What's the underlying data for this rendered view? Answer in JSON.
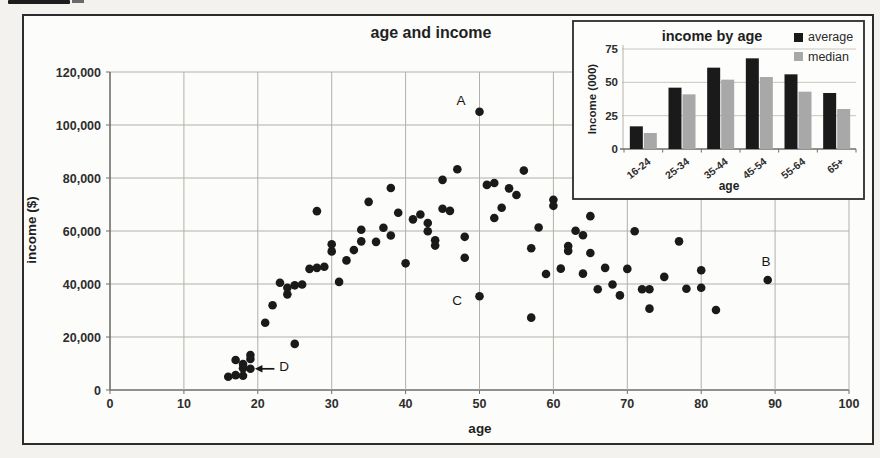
{
  "chart_data": [
    {
      "type": "scatter",
      "title": "age and income",
      "xlabel": "age",
      "ylabel": "income ($)",
      "xlim": [
        0,
        100
      ],
      "ylim": [
        0,
        120000
      ],
      "xticks": [
        0,
        10,
        20,
        30,
        40,
        50,
        60,
        70,
        80,
        90,
        100
      ],
      "yticks": [
        0,
        20000,
        40000,
        60000,
        80000,
        100000,
        120000
      ],
      "ytick_labels": [
        "0",
        "20,000",
        "40,000",
        "60,000",
        "80,000",
        "100,000",
        "120,000"
      ],
      "grid": true,
      "point_color": "#1a1a1a",
      "points": [
        [
          16,
          5000
        ],
        [
          17,
          5600
        ],
        [
          18,
          5400
        ],
        [
          18,
          8200
        ],
        [
          19,
          8000
        ],
        [
          17,
          11300
        ],
        [
          18,
          9800
        ],
        [
          19,
          13200
        ],
        [
          19,
          11700
        ],
        [
          21,
          25400
        ],
        [
          22,
          32000
        ],
        [
          23,
          40500
        ],
        [
          24,
          36100
        ],
        [
          24,
          38600
        ],
        [
          25,
          17400
        ],
        [
          25,
          39500
        ],
        [
          26,
          39800
        ],
        [
          27,
          45700
        ],
        [
          28,
          46100
        ],
        [
          29,
          46500
        ],
        [
          28,
          67500
        ],
        [
          30,
          55000
        ],
        [
          30,
          52300
        ],
        [
          31,
          40800
        ],
        [
          32,
          48900
        ],
        [
          33,
          52800
        ],
        [
          34,
          60500
        ],
        [
          34,
          56100
        ],
        [
          35,
          71000
        ],
        [
          36,
          55900
        ],
        [
          37,
          61200
        ],
        [
          38,
          58300
        ],
        [
          38,
          76200
        ],
        [
          39,
          66900
        ],
        [
          40,
          47800
        ],
        [
          41,
          64400
        ],
        [
          42,
          66200
        ],
        [
          43,
          63000
        ],
        [
          43,
          59900
        ],
        [
          44,
          56500
        ],
        [
          44,
          54500
        ],
        [
          45,
          79300
        ],
        [
          45,
          68400
        ],
        [
          46,
          67600
        ],
        [
          47,
          83300
        ],
        [
          48,
          57800
        ],
        [
          48,
          49900
        ],
        [
          50,
          105000
        ],
        [
          50,
          35400
        ],
        [
          51,
          77400
        ],
        [
          52,
          78100
        ],
        [
          52,
          64900
        ],
        [
          53,
          68800
        ],
        [
          54,
          76100
        ],
        [
          55,
          73600
        ],
        [
          56,
          82800
        ],
        [
          57,
          53500
        ],
        [
          57,
          27300
        ],
        [
          58,
          61300
        ],
        [
          59,
          43800
        ],
        [
          60,
          71800
        ],
        [
          60,
          69500
        ],
        [
          61,
          45800
        ],
        [
          62,
          54300
        ],
        [
          62,
          52500
        ],
        [
          63,
          60100
        ],
        [
          64,
          58400
        ],
        [
          64,
          43900
        ],
        [
          65,
          65600
        ],
        [
          65,
          51700
        ],
        [
          66,
          38000
        ],
        [
          67,
          46100
        ],
        [
          68,
          39800
        ],
        [
          69,
          35700
        ],
        [
          70,
          45700
        ],
        [
          71,
          59900
        ],
        [
          72,
          38000
        ],
        [
          73,
          38000
        ],
        [
          73,
          30700
        ],
        [
          75,
          42700
        ],
        [
          77,
          56100
        ],
        [
          78,
          38200
        ],
        [
          80,
          45200
        ],
        [
          80,
          38600
        ],
        [
          82,
          30200
        ],
        [
          89,
          41500
        ]
      ],
      "annotations": [
        {
          "label": "A",
          "age": 50,
          "income": 105000
        },
        {
          "label": "B",
          "age": 89,
          "income": 41500
        },
        {
          "label": "C",
          "age": 50,
          "income": 35400
        },
        {
          "label": "D",
          "age": 19,
          "income": 8000,
          "arrow": true
        }
      ]
    },
    {
      "type": "bar",
      "title": "income by age",
      "xlabel": "age",
      "ylabel": "Income (000)",
      "categories": [
        "16-24",
        "25-34",
        "35-44",
        "45-54",
        "55-64",
        "65+"
      ],
      "series": [
        {
          "name": "average",
          "color": "#1a1a1a",
          "values": [
            17,
            46,
            61,
            68,
            56,
            42
          ]
        },
        {
          "name": "median",
          "color": "#a8a8a8",
          "values": [
            12,
            41,
            52,
            54,
            43,
            30
          ]
        }
      ],
      "yticks": [
        0,
        25,
        50,
        75
      ],
      "ylim": [
        0,
        75
      ],
      "legend_position": "top-right",
      "grid": true
    }
  ]
}
